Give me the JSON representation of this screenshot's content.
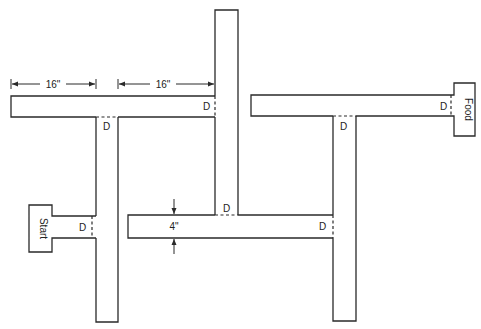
{
  "diagram": {
    "type": "T-maze floor plan",
    "colors": {
      "line": "#2a2a2a",
      "background": "#ffffff"
    },
    "dimensions": {
      "arm_length_left": "16\"",
      "arm_length_right": "16\"",
      "corridor_width": "4\""
    },
    "goal_boxes": {
      "start": "Start",
      "food": "Food"
    },
    "doors": {
      "label": "D",
      "d1": "D",
      "d2": "D",
      "d3": "D",
      "d4": "D",
      "d5": "D",
      "d6": "D",
      "d7": "D",
      "d8": "D"
    }
  }
}
